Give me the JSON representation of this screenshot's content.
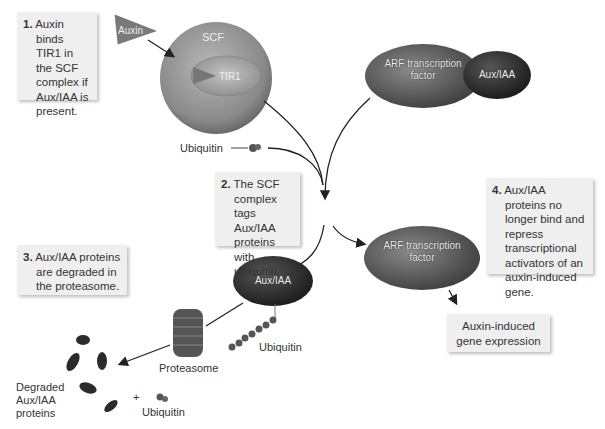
{
  "steps": [
    {
      "num": "1.",
      "text": "Auxin binds TIR1 in the SCF complex if Aux/IAA is present."
    },
    {
      "num": "2.",
      "text": "The SCF complex tags Aux/IAA proteins with ubiquitin."
    },
    {
      "num": "3.",
      "text": "Aux/IAA proteins are degraded in the proteasome."
    },
    {
      "num": "4.",
      "text": "Aux/IAA proteins no longer bind and repress transcriptional activators of an auxin-induced gene."
    }
  ],
  "molecules": {
    "auxin": "Auxin",
    "scf": "SCF",
    "tir1": "TIR1",
    "arf_top": "ARF transcription factor",
    "auxiaa_top": "Aux/IAA",
    "auxiaa_tagged": "Aux/IAA",
    "arf_free": "ARF transcription factor"
  },
  "labels": {
    "ubiquitin_top": "Ubiquitin",
    "ubiquitin_chain": "Ubiquitin",
    "proteasome": "Proteasome",
    "degraded": "Degraded Aux/IAA proteins",
    "plus": "+",
    "ubiquitin_bottom": "Ubiquitin",
    "outcome": "Auxin-induced gene expression"
  },
  "colors": {
    "box_bg": "#efefef",
    "molecule_dark": "#3a3a3a",
    "molecule_mid": "#6e6e6e",
    "scf_light": "#a8a8a8",
    "arrow": "#222222"
  }
}
